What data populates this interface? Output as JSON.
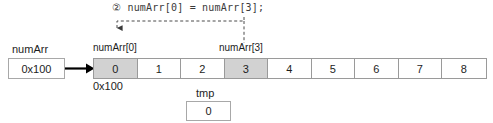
{
  "diagram": {
    "annotation": {
      "step_marker": "②",
      "code": "② numArr[0] = numArr[3];"
    },
    "pointer": {
      "name": "numArr",
      "value": "0x100"
    },
    "array": {
      "base_address": "0x100",
      "cells": [
        {
          "value": "0",
          "shaded": true
        },
        {
          "value": "1",
          "shaded": false
        },
        {
          "value": "2",
          "shaded": false
        },
        {
          "value": "3",
          "shaded": true
        },
        {
          "value": "4",
          "shaded": false
        },
        {
          "value": "5",
          "shaded": false
        },
        {
          "value": "6",
          "shaded": false
        },
        {
          "value": "7",
          "shaded": false
        },
        {
          "value": "8",
          "shaded": false
        }
      ],
      "index_labels": {
        "source": "numArr[3]",
        "destination": "numArr[0]"
      }
    },
    "tmp": {
      "name": "tmp",
      "value": "0"
    },
    "colors": {
      "shaded_cell": "#d2d2d2",
      "border": "#9a9a9a",
      "text": "#1d1d1d",
      "dashed_line": "#4a4a4a",
      "arrow": "#000000"
    }
  }
}
